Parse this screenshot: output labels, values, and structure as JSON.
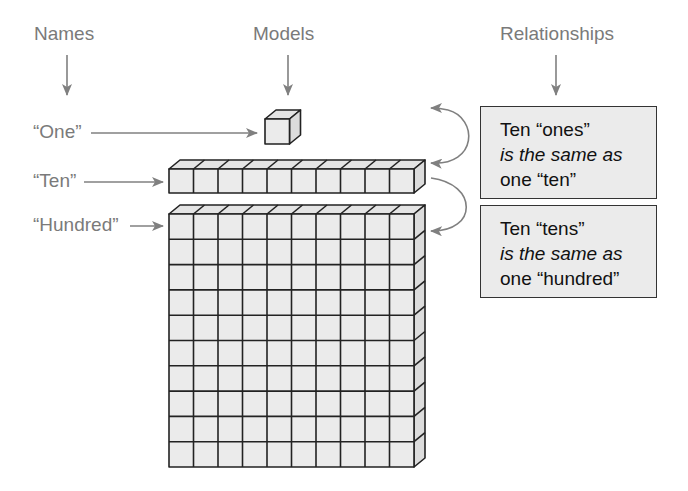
{
  "headers": {
    "names": "Names",
    "models": "Models",
    "relationships": "Relationships"
  },
  "labels": {
    "one": "“One”",
    "ten": "“Ten”",
    "hundred": "“Hundred”"
  },
  "relationships": [
    {
      "line1": "Ten “ones”",
      "line2": "is the same as",
      "line3": "one “ten”"
    },
    {
      "line1": "Ten “tens”",
      "line2": "is the same as",
      "line3": "one “hundred”"
    }
  ],
  "models": {
    "one": {
      "cubes": 1
    },
    "ten": {
      "cubes": 10,
      "rows": 1
    },
    "hundred": {
      "cols": 10,
      "rows": 10
    }
  },
  "colors": {
    "text_label": "#7a7a7a",
    "arrow": "#808080",
    "cube_face": "#ebebeb",
    "cube_edge": "#222222",
    "box_fill": "#ebebeb"
  }
}
